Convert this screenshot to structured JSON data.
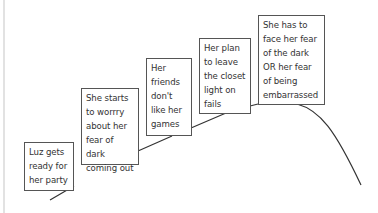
{
  "diagram": {
    "type": "story-plot-mountain",
    "events": [
      {
        "id": 1,
        "text": "Luz gets\nready for\nher party"
      },
      {
        "id": 2,
        "text": "She starts\nto worrry\nabout her\nfear of dark\ncoming out"
      },
      {
        "id": 3,
        "text": "Her\nfriends\ndon't\nlike her\ngames"
      },
      {
        "id": 4,
        "text": "Her plan\nto leave\nthe closet\nlight on\nfails"
      },
      {
        "id": 5,
        "text": "She has to\nface her fear\nof the dark\nOR her fear\nof being\nembarrassed"
      }
    ],
    "colors": {
      "line": "#333333",
      "box_border": "#555555",
      "text": "#333333",
      "background": "#ffffff"
    }
  }
}
